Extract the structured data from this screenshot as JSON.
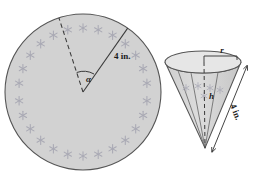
{
  "figure": {
    "background": "#ffffff",
    "fill_color": "#d2d2d2",
    "fill_color_light": "#dcdcdc",
    "stroke_color": "#4a4a4a",
    "decoration_color": "#a9a9b4",
    "label_color": "#1a1a1a"
  },
  "circle": {
    "name": "paper-disk",
    "center_x": 83,
    "center_y": 92,
    "radius": 78,
    "radius_label": "4 in.",
    "angle_label": "α",
    "sector": {
      "dashed_radius_angle_deg": -108,
      "solid_radius_angle_deg": -55
    },
    "decoration": {
      "glyph": "star-icon",
      "count": 26,
      "ring_radius": 64
    }
  },
  "cone": {
    "name": "cone",
    "radius_label": "r",
    "height_label": "h",
    "slant_label": "4 in.",
    "apex_x": 205,
    "apex_y": 148,
    "rim_center_x": 203,
    "rim_center_y": 62,
    "rim_rx": 38,
    "rim_ry": 11,
    "decoration": {
      "glyph": "star-icon",
      "count": 5
    }
  }
}
